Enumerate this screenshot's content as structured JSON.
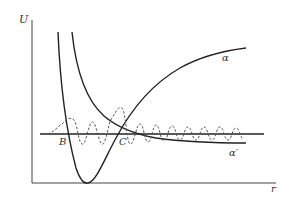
{
  "diagram": {
    "type": "potential-energy-diagram",
    "axes": {
      "y_label": "U",
      "x_label": "r"
    },
    "curves": [
      {
        "id": "alpha",
        "label": "α",
        "description": "bound potential well rising to asymptote"
      },
      {
        "id": "alpha_prime",
        "label": "α′",
        "description": "repulsive potential decaying to asymptote"
      }
    ],
    "points": [
      {
        "id": "B",
        "label": "B"
      },
      {
        "id": "C",
        "label": "C"
      }
    ],
    "energy_level": "horizontal line",
    "wavefunction": "dashed oscillating curve"
  },
  "colors": {
    "ink": "#222222",
    "label": "#333333",
    "dashed": "#555555",
    "background": "#ffffff"
  }
}
